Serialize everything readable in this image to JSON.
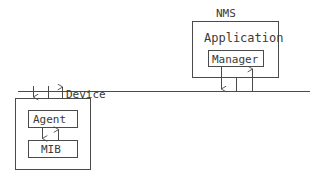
{
  "diagram": {
    "stroke_color": "#4a4a4a",
    "text_color": "#3a3a3a",
    "background_color": "#ffffff",
    "nms": {
      "label": "NMS",
      "application_label": "Application",
      "manager_label": "Manager"
    },
    "bus": {
      "label": "Device"
    },
    "device": {
      "agent_label": "Agent",
      "mib_label": "MIB"
    },
    "arrows": {
      "nms_down_name": "manager-to-network-down-arrow",
      "nms_up_name": "network-to-manager-up-arrow",
      "device_down_name": "network-to-device-down-arrow",
      "device_up_name": "device-to-network-up-arrow",
      "agent_down_name": "agent-to-mib-down-arrow",
      "mib_up_name": "mib-to-agent-up-arrow"
    }
  }
}
